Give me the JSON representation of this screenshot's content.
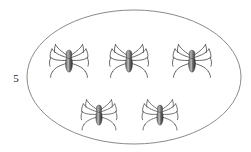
{
  "figure": {
    "kind": "counting-set-diagram",
    "background_color": "#ffffff",
    "count_label": "5",
    "count_label_position": {
      "x": 16,
      "y": 82
    },
    "group": {
      "shape_name": "ellipse",
      "stroke_color": "#8a8a8a",
      "stroke_width": 1,
      "fill_color": "none",
      "center": {
        "x": 134,
        "y": 77
      },
      "radius_x": 107,
      "radius_y": 67
    },
    "object_name": "spider",
    "object_count": 5,
    "object_colors": {
      "body_dark": "#3b3b3b",
      "body_mid": "#6e6e6e",
      "body_highlight": "#c9c9c9",
      "leg": "#4a4a4a"
    },
    "objects": [
      {
        "label": "spider-1",
        "row": "top",
        "x": 69,
        "y": 60,
        "scale": 1.0
      },
      {
        "label": "spider-2",
        "row": "top",
        "x": 129,
        "y": 60,
        "scale": 1.0
      },
      {
        "label": "spider-3",
        "row": "top",
        "x": 192,
        "y": 60,
        "scale": 1.0
      },
      {
        "label": "spider-4",
        "row": "bottom",
        "x": 99,
        "y": 114,
        "scale": 0.92
      },
      {
        "label": "spider-5",
        "row": "bottom",
        "x": 160,
        "y": 114,
        "scale": 0.92
      }
    ]
  }
}
